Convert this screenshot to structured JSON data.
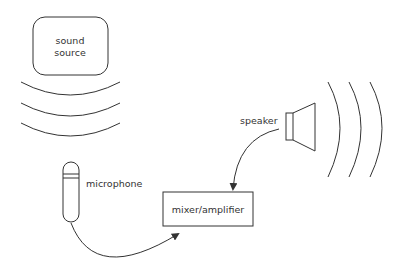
{
  "diagram": {
    "title": "",
    "nodes": {
      "sound_source": {
        "line1": "sound",
        "line2": "source"
      },
      "speaker": {
        "label": "speaker"
      },
      "microphone": {
        "label": "microphone"
      },
      "mixer": {
        "label": "mixer/amplifier"
      }
    },
    "edges": [
      {
        "from": "speaker",
        "to": "mixer"
      },
      {
        "from": "microphone",
        "to": "mixer"
      }
    ],
    "colors": {
      "stroke": "#333333",
      "background": "#ffffff"
    }
  }
}
